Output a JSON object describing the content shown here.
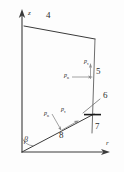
{
  "figure": {
    "type": "technical-line-diagram",
    "background_color": "#fdfdfd",
    "line_color": "#3a3a3a",
    "text_color": "#2c2c2c"
  },
  "axes": {
    "vertical": {
      "label": "z",
      "direction": "up"
    },
    "horizontal": {
      "label": "r",
      "direction": "right"
    },
    "origin_label": ""
  },
  "boundary_labels": {
    "top": "4",
    "right_upper": "5",
    "leader": "6",
    "right_lower": "7",
    "inclined": "8"
  },
  "angle": {
    "symbol": "β"
  },
  "vectors": {
    "right_edge_normal": {
      "p": "p",
      "sub": "n"
    },
    "right_edge_shear": {
      "p": "p",
      "sub": "τ"
    },
    "inclined_normal": {
      "p": "p",
      "sub": "n"
    },
    "inclined_shear": {
      "p": "p",
      "sub": "τ"
    }
  },
  "geometry": {
    "origin": [
      22,
      152
    ],
    "z_axis_top": [
      22,
      12
    ],
    "top_left_corner": [
      24,
      26
    ],
    "top_right_corner": [
      95,
      39
    ],
    "right_edge_bottom": [
      92,
      133
    ],
    "inclined_end": [
      94,
      114
    ],
    "leader_start": [
      100,
      98
    ],
    "leader_end": [
      82,
      113
    ]
  }
}
